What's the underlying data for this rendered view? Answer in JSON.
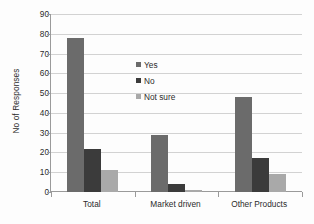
{
  "chart_data": {
    "type": "bar",
    "title": "",
    "xlabel": "",
    "ylabel": "No of Responses",
    "categories": [
      "Total",
      "Market driven",
      "Other Products"
    ],
    "series": [
      {
        "name": "Yes",
        "color": "#6b6b6b",
        "values": [
          78,
          29,
          48
        ]
      },
      {
        "name": "No",
        "color": "#3b3b3b",
        "values": [
          22,
          4,
          17
        ]
      },
      {
        "name": "Not sure",
        "color": "#a9a9a9",
        "values": [
          11,
          1,
          9
        ]
      }
    ],
    "ylim": [
      0,
      90
    ],
    "yticks": [
      0,
      10,
      20,
      30,
      40,
      50,
      60,
      70,
      80,
      90
    ],
    "ytick_labels": [
      "0",
      "10",
      "20",
      "30",
      "40",
      "50",
      "60",
      "70",
      "80",
      "90"
    ],
    "grid": true,
    "grid_axis": "y",
    "legend_position": "center-left-inside",
    "background": "#ffffff"
  }
}
